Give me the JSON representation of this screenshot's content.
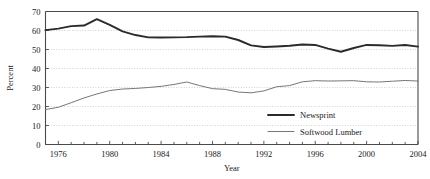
{
  "chart_data": {
    "type": "line",
    "title": "",
    "xlabel": "Year",
    "ylabel": "Percent",
    "xlim": [
      1975,
      2004
    ],
    "ylim": [
      0,
      70
    ],
    "ytick_step": 10,
    "yticks": [
      0,
      10,
      20,
      30,
      40,
      50,
      60,
      70
    ],
    "xticks_major": [
      1976,
      1980,
      1984,
      1988,
      1992,
      1996,
      2000,
      2004
    ],
    "xticks_minor_every": 1,
    "grid": "horizontal-dotted",
    "legend_position": "inside-lower-right",
    "x": [
      1975,
      1976,
      1977,
      1978,
      1979,
      1980,
      1981,
      1982,
      1983,
      1984,
      1985,
      1986,
      1987,
      1988,
      1989,
      1990,
      1991,
      1992,
      1993,
      1994,
      1995,
      1996,
      1997,
      1998,
      1999,
      2000,
      2001,
      2002,
      2003,
      2004
    ],
    "series": [
      {
        "name": "Newsprint",
        "color": "#2b2b2b",
        "width": 1.9,
        "values": [
          60.2,
          61.0,
          62.3,
          62.6,
          66.0,
          63.0,
          59.5,
          57.6,
          56.4,
          56.3,
          56.4,
          56.5,
          56.8,
          57.0,
          56.8,
          55.0,
          52.2,
          51.3,
          51.6,
          52.0,
          52.6,
          52.4,
          50.5,
          48.8,
          50.8,
          52.4,
          52.2,
          51.9,
          52.4,
          51.5
        ]
      },
      {
        "name": "Softwood Lumber",
        "color": "#6f6f6f",
        "width": 0.95,
        "values": [
          18.4,
          19.6,
          22.0,
          24.5,
          26.6,
          28.4,
          29.2,
          29.5,
          30.0,
          30.6,
          31.6,
          32.9,
          31.0,
          29.4,
          29.0,
          27.6,
          27.2,
          28.2,
          30.4,
          31.0,
          33.0,
          33.6,
          33.4,
          33.5,
          33.6,
          33.0,
          32.9,
          33.3,
          33.7,
          33.4
        ]
      }
    ]
  },
  "legend": {
    "entries": [
      {
        "label": "Newsprint"
      },
      {
        "label": "Softwood Lumber"
      }
    ]
  },
  "axes": {
    "y_title": "Percent",
    "x_title": "Year",
    "y_tick_labels": [
      "0",
      "10",
      "20",
      "30",
      "40",
      "50",
      "60",
      "70"
    ],
    "x_tick_labels": [
      "1976",
      "1980",
      "1984",
      "1988",
      "1992",
      "1996",
      "2000",
      "2004"
    ]
  }
}
